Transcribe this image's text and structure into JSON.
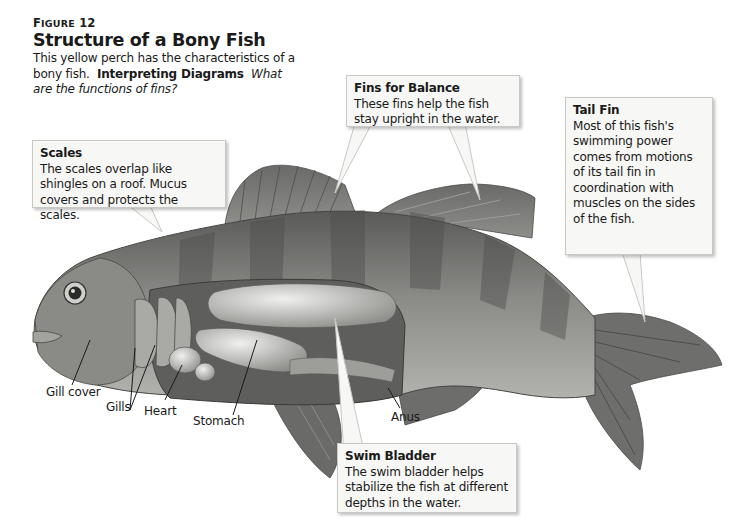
{
  "figure": {
    "number_prefix": "F",
    "number_rest": "IGURE",
    "number": "12",
    "title": "Structure of a Bony Fish",
    "caption_plain": "This yellow perch has the characteristics of a bony fish.",
    "caption_bold": "Interpreting Diagrams",
    "caption_question": "What are the functions of fins?"
  },
  "callouts": {
    "fins_balance": {
      "title": "Fins for Balance",
      "text": "These fins help the fish stay upright in the water."
    },
    "tail_fin": {
      "title": "Tail Fin",
      "text": "Most of this fish's swimming power comes from motions of its tail fin in coordination with muscles on the sides of the fish."
    },
    "scales": {
      "title": "Scales",
      "text": "The scales overlap like shingles on a roof. Mucus covers and protects the scales."
    },
    "swim_bladder": {
      "title": "Swim Bladder",
      "text": "The swim bladder helps stabilize the fish at different depths in the water."
    }
  },
  "labels": {
    "gill_cover": "Gill cover",
    "gills": "Gills",
    "heart": "Heart",
    "stomach": "Stomach",
    "anus": "Anus"
  },
  "colors": {
    "body": "#7a7a78",
    "body_dark": "#555553",
    "belly": "#a9a9a6",
    "organs": "#c9c9c6",
    "cavity": "#5e5e5c",
    "callout_bg": "#f7f7f5"
  }
}
